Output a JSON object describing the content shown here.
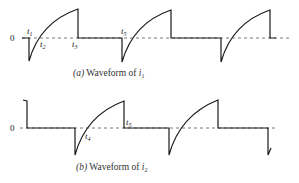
{
  "figure": {
    "panel_a": {
      "caption_prefix": "(a)",
      "caption_text": " Waveform of ",
      "caption_var": "i",
      "caption_sub": "1",
      "zero_label": "0",
      "time_labels": [
        {
          "name": "t",
          "sub": "1"
        },
        {
          "name": "t",
          "sub": "2"
        },
        {
          "name": "t",
          "sub": "3"
        },
        {
          "name": "t",
          "sub": "5"
        }
      ]
    },
    "panel_b": {
      "caption_prefix": "(b)",
      "caption_text": " Waveform of ",
      "caption_var": "i",
      "caption_sub": "2",
      "zero_label": "0",
      "time_labels": [
        {
          "name": "t",
          "sub": "4"
        },
        {
          "name": "t",
          "sub": "5"
        }
      ]
    }
  },
  "colors": {
    "waveform": "#1a1a1a",
    "baseline": "#555555",
    "background": "#ffffff"
  }
}
